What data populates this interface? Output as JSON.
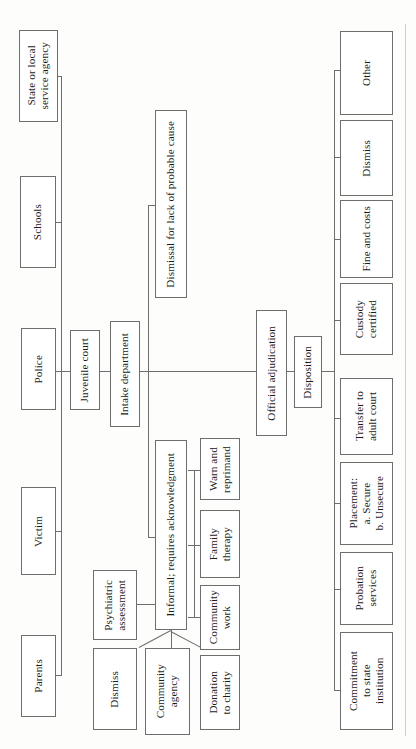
{
  "diagram": {
    "orientation": "rotated-90",
    "colors": {
      "border": "#6e6e6e",
      "text": "#1b1b1b",
      "background": "#ffffff"
    },
    "sources": {
      "label": "Referral sources",
      "items": [
        {
          "id": "state-agency",
          "label": "State or local\nservice agency"
        },
        {
          "id": "schools",
          "label": "Schools"
        },
        {
          "id": "police",
          "label": "Police"
        },
        {
          "id": "victim",
          "label": "Victim"
        },
        {
          "id": "parents",
          "label": "Parents"
        }
      ]
    },
    "court": {
      "juvenile_court": "Juvenile court",
      "intake_department": "Intake department"
    },
    "intake_outcomes": [
      {
        "id": "dismissal-probable-cause",
        "label": "Dismissal for lack of probable cause"
      },
      {
        "id": "informal",
        "label": "Informal; requires acknowledgment"
      },
      {
        "id": "official-adjudication",
        "label": "Official adjudication"
      }
    ],
    "informal_options": [
      {
        "id": "psychiatric-assessment",
        "label": "Psychiatric\nassessment"
      },
      {
        "id": "warn-and-reprimand",
        "label": "Warn and\nreprimand"
      },
      {
        "id": "family-therapy",
        "label": "Family\ntherapy"
      },
      {
        "id": "community-work",
        "label": "Community\nwork"
      },
      {
        "id": "dismiss-informal",
        "label": "Dismiss"
      },
      {
        "id": "community-agency",
        "label": "Community\nagency"
      },
      {
        "id": "donation-to-charity",
        "label": "Donation\nto charity"
      }
    ],
    "disposition": {
      "label": "Disposition"
    },
    "disposition_outcomes": [
      {
        "id": "other",
        "label": "Other"
      },
      {
        "id": "dismiss-disposition",
        "label": "Dismiss"
      },
      {
        "id": "fine-and-costs",
        "label": "Fine and costs"
      },
      {
        "id": "custody-certified",
        "label": "Custody\ncertified"
      },
      {
        "id": "transfer-to-adult-court",
        "label": "Transfer to\nadult court"
      },
      {
        "id": "placement",
        "label": "Placement:\na. Secure\nb. Unsecure"
      },
      {
        "id": "probation-services",
        "label": "Probation\nservices"
      },
      {
        "id": "commitment-state",
        "label": "Commitment\nto state\ninstitution"
      }
    ]
  }
}
